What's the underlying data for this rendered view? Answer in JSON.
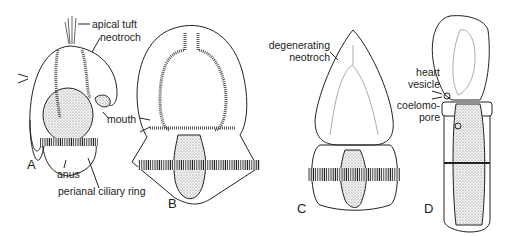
{
  "figure": {
    "panels": [
      "A",
      "B",
      "C",
      "D"
    ],
    "labels": {
      "apical_tuft": "apical tuft",
      "neotroch": "neotroch",
      "mouth": "mouth",
      "anus": "anus",
      "perianal_ring": "perianal ciliary ring",
      "degenerating_1": "degenerating",
      "degenerating_2": "neotroch",
      "heart_1": "heart",
      "heart_2": "vesicle",
      "coelomo_1": "coelomo-",
      "coelomo_2": "pore"
    }
  }
}
